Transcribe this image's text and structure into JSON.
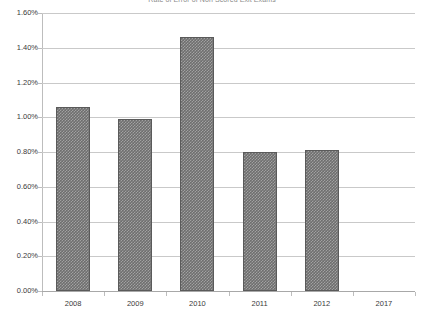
{
  "chart_data": {
    "type": "bar",
    "title": "Rate of Error of Non Scored Exit Exams",
    "xlabel": "",
    "ylabel": "",
    "categories": [
      "2008",
      "2009",
      "2010",
      "2011",
      "2012",
      "2017"
    ],
    "values": [
      1.06,
      0.99,
      1.46,
      0.8,
      0.81,
      null
    ],
    "value_labels": [
      "1.06%",
      "0.99%",
      "1.46%",
      "0.80%",
      "0.81%",
      ""
    ],
    "ylim": [
      0.0,
      1.6
    ],
    "ytick_values": [
      0.0,
      0.2,
      0.4,
      0.6,
      0.8,
      1.0,
      1.2,
      1.4,
      1.6
    ],
    "ytick_labels": [
      "0.00%",
      "0.20%",
      "0.40%",
      "0.60%",
      "0.80%",
      "1.00%",
      "1.20%",
      "1.40%",
      "1.60%"
    ],
    "grid": true,
    "legend": false,
    "legend_position": "none",
    "series": [
      {
        "name": "Rate of Error",
        "values": [
          1.06,
          0.99,
          1.46,
          0.8,
          0.81,
          null
        ],
        "color": "#6e6e6e",
        "fill_pattern": "checker-dots",
        "border_color": "#5a5a5a"
      }
    ]
  },
  "colors": {
    "bar_fill": "#6e6e6e",
    "bar_border": "#5a5a5a",
    "gridline": "#c9c9c9",
    "axis_line": "#a8a8a8",
    "tick_text": "#3a3a3a",
    "title_text": "#8a8a8a",
    "background": "#ffffff"
  }
}
